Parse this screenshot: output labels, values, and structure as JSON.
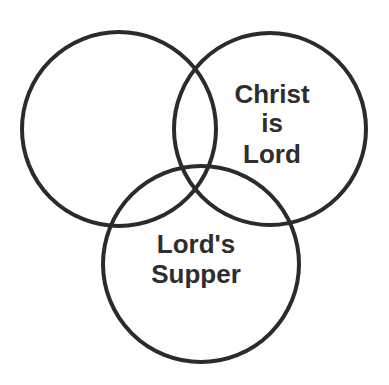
{
  "diagram": {
    "type": "venn",
    "stroke_color": "#2b2b2b",
    "text_color": "#2e2e2e",
    "background": "#ffffff",
    "circles": [
      {
        "id": "left",
        "cx": 119,
        "cy": 129,
        "r": 97,
        "label_lines": []
      },
      {
        "id": "right",
        "cx": 270,
        "cy": 129,
        "r": 96,
        "label_lines": [
          "Christ",
          "is",
          "Lord"
        ]
      },
      {
        "id": "bottom",
        "cx": 201,
        "cy": 264,
        "r": 98,
        "label_lines": [
          "Lord's",
          "Supper"
        ]
      }
    ],
    "labels": {
      "right": {
        "line1": "Christ",
        "line2": "is",
        "line3": "Lord"
      },
      "bottom": {
        "line1": "Lord's",
        "line2": "Supper"
      }
    }
  }
}
